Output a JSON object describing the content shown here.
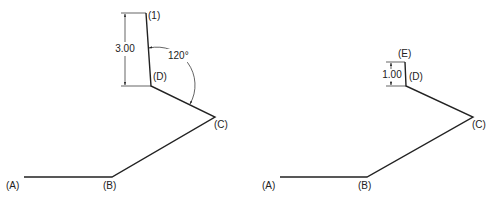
{
  "left_figure": {
    "labels": {
      "A": "(A)",
      "B": "(B)",
      "C": "(C)",
      "D": "(D)",
      "P1": "(1)"
    },
    "dimension_length": "3.00",
    "angle": "120°"
  },
  "right_figure": {
    "labels": {
      "A": "(A)",
      "B": "(B)",
      "C": "(C)",
      "D": "(D)",
      "E": "(E)"
    },
    "dimension_length": "1.00"
  },
  "colors": {
    "line": "#222222",
    "background": "#ffffff"
  }
}
